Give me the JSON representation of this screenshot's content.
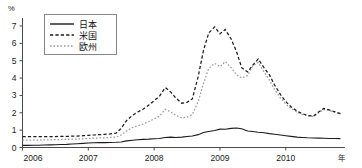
{
  "chart_data": {
    "type": "line",
    "title": "",
    "xlabel": "年",
    "ylabel": "%",
    "ylim": [
      0,
      7
    ],
    "xlim": [
      2006.0,
      2010.9
    ],
    "grid": false,
    "legend_position": "top-left",
    "yticks": [
      "0",
      "1",
      "2",
      "3",
      "4",
      "5",
      "6",
      "7"
    ],
    "ytick_values": [
      0,
      1,
      2,
      3,
      4,
      5,
      6,
      7
    ],
    "xticks": [
      "2006",
      "2007",
      "2008",
      "2009",
      "2010"
    ],
    "xtick_values": [
      2006,
      2007,
      2008,
      2009,
      2010
    ],
    "series": [
      {
        "name": "日本",
        "style": "solid",
        "color": "#1a1a1a",
        "x": [
          2006.0,
          2006.08,
          2006.17,
          2006.25,
          2006.33,
          2006.42,
          2006.5,
          2006.58,
          2006.67,
          2006.75,
          2006.83,
          2006.92,
          2007.0,
          2007.08,
          2007.17,
          2007.25,
          2007.33,
          2007.42,
          2007.5,
          2007.58,
          2007.67,
          2007.75,
          2007.83,
          2007.92,
          2008.0,
          2008.08,
          2008.17,
          2008.25,
          2008.33,
          2008.42,
          2008.5,
          2008.58,
          2008.67,
          2008.75,
          2008.83,
          2008.92,
          2009.0,
          2009.08,
          2009.17,
          2009.25,
          2009.33,
          2009.42,
          2009.5,
          2009.58,
          2009.67,
          2009.75,
          2009.83,
          2009.92,
          2010.0,
          2010.08,
          2010.17,
          2010.25,
          2010.33,
          2010.42,
          2010.5,
          2010.58,
          2010.67,
          2010.75,
          2010.83
        ],
        "values": [
          0.12,
          0.12,
          0.13,
          0.13,
          0.14,
          0.15,
          0.16,
          0.17,
          0.18,
          0.2,
          0.22,
          0.24,
          0.26,
          0.27,
          0.28,
          0.28,
          0.29,
          0.3,
          0.32,
          0.38,
          0.42,
          0.45,
          0.47,
          0.48,
          0.5,
          0.52,
          0.58,
          0.6,
          0.58,
          0.6,
          0.63,
          0.66,
          0.74,
          0.86,
          0.92,
          0.98,
          1.06,
          1.05,
          1.1,
          1.12,
          1.08,
          0.95,
          0.92,
          0.88,
          0.85,
          0.8,
          0.76,
          0.72,
          0.68,
          0.64,
          0.6,
          0.58,
          0.56,
          0.55,
          0.54,
          0.53,
          0.52,
          0.52,
          0.51
        ]
      },
      {
        "name": "米国",
        "style": "dashed",
        "color": "#1a1a1a",
        "x": [
          2006.0,
          2006.08,
          2006.17,
          2006.25,
          2006.33,
          2006.42,
          2006.5,
          2006.58,
          2006.67,
          2006.75,
          2006.83,
          2006.92,
          2007.0,
          2007.08,
          2007.17,
          2007.25,
          2007.33,
          2007.42,
          2007.5,
          2007.58,
          2007.67,
          2007.75,
          2007.83,
          2007.92,
          2008.0,
          2008.08,
          2008.17,
          2008.25,
          2008.33,
          2008.42,
          2008.5,
          2008.58,
          2008.67,
          2008.75,
          2008.83,
          2008.92,
          2009.0,
          2009.08,
          2009.17,
          2009.25,
          2009.33,
          2009.42,
          2009.5,
          2009.58,
          2009.67,
          2009.75,
          2009.83,
          2009.92,
          2010.0,
          2010.08,
          2010.17,
          2010.25,
          2010.33,
          2010.42,
          2010.5,
          2010.58,
          2010.67,
          2010.75,
          2010.83
        ],
        "values": [
          0.62,
          0.62,
          0.63,
          0.63,
          0.62,
          0.62,
          0.63,
          0.64,
          0.64,
          0.65,
          0.66,
          0.68,
          0.7,
          0.72,
          0.74,
          0.76,
          0.78,
          0.82,
          1.1,
          1.55,
          1.85,
          2.05,
          2.2,
          2.45,
          2.7,
          2.95,
          3.45,
          3.2,
          2.85,
          2.55,
          2.6,
          2.8,
          4.1,
          5.6,
          6.6,
          6.95,
          6.55,
          6.8,
          6.25,
          5.55,
          4.6,
          4.35,
          4.75,
          5.1,
          4.6,
          4.2,
          3.6,
          3.05,
          2.65,
          2.35,
          2.1,
          1.95,
          1.85,
          1.8,
          2.05,
          2.25,
          2.15,
          2.05,
          1.95
        ]
      },
      {
        "name": "欧州",
        "style": "dotted",
        "color": "#9a9a9a",
        "x": [
          2006.0,
          2006.08,
          2006.17,
          2006.25,
          2006.33,
          2006.42,
          2006.5,
          2006.58,
          2006.67,
          2006.75,
          2006.83,
          2006.92,
          2007.0,
          2007.08,
          2007.17,
          2007.25,
          2007.33,
          2007.42,
          2007.5,
          2007.58,
          2007.67,
          2007.75,
          2007.83,
          2007.92,
          2008.0,
          2008.08,
          2008.17,
          2008.25,
          2008.33,
          2008.42,
          2008.5,
          2008.58,
          2008.67,
          2008.75,
          2008.83,
          2008.92,
          2009.0,
          2009.08,
          2009.17,
          2009.25,
          2009.33,
          2009.42,
          2009.5,
          2009.58,
          2009.67,
          2009.75,
          2009.83,
          2009.92,
          2010.0,
          2010.08,
          2010.17,
          2010.25,
          2010.33,
          2010.42,
          2010.5,
          2010.58,
          2010.67,
          2010.75,
          2010.83
        ],
        "values": [
          0.42,
          0.42,
          0.43,
          0.43,
          0.44,
          0.44,
          0.45,
          0.46,
          0.47,
          0.48,
          0.49,
          0.5,
          0.52,
          0.54,
          0.55,
          0.56,
          0.58,
          0.6,
          0.72,
          0.95,
          1.15,
          1.25,
          1.35,
          1.5,
          1.65,
          1.8,
          2.2,
          2.05,
          1.85,
          1.7,
          1.75,
          1.9,
          2.65,
          3.7,
          4.55,
          4.85,
          4.65,
          4.95,
          4.6,
          4.2,
          4.0,
          4.15,
          4.7,
          4.9,
          4.35,
          3.9,
          3.35,
          2.85,
          2.5,
          2.25,
          2.05,
          1.9,
          1.82,
          1.78,
          2.0,
          2.2,
          2.12,
          2.02,
          1.92
        ]
      }
    ]
  },
  "legend": {
    "entries": [
      {
        "label": "日本"
      },
      {
        "label": "米国"
      },
      {
        "label": "欧州"
      }
    ]
  }
}
